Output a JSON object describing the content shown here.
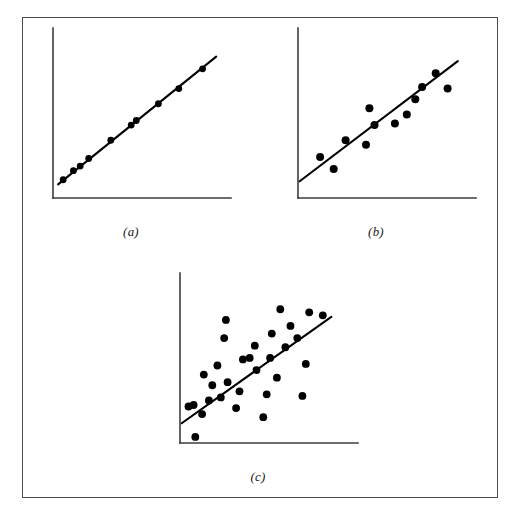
{
  "figure": {
    "caption_a": "(a)",
    "caption_b": "(b)",
    "caption_c": "(c)",
    "border_color": "#4a4a4a",
    "axis_color": "#3d3d3d",
    "line_color": "#000000",
    "point_color": "#000000",
    "background_color": "#ffffff"
  },
  "chart_data": [
    {
      "type": "scatter",
      "id": "panel-a",
      "title": "(a)",
      "xlabel": "",
      "ylabel": "",
      "grid": false,
      "legend": "none",
      "xlim": [
        0,
        100
      ],
      "ylim": [
        0,
        100
      ],
      "axis_ticks": [],
      "description": "Near-perfect positive linear relationship; points lie essentially on the fitted line",
      "fit_line": {
        "x": [
          3,
          96
        ],
        "y": [
          9,
          93
        ]
      },
      "point_radius": 3.4,
      "points": [
        {
          "x": 6,
          "y": 12
        },
        {
          "x": 12,
          "y": 18
        },
        {
          "x": 16,
          "y": 21
        },
        {
          "x": 21,
          "y": 26
        },
        {
          "x": 34,
          "y": 38
        },
        {
          "x": 46,
          "y": 48
        },
        {
          "x": 49,
          "y": 51
        },
        {
          "x": 62,
          "y": 62
        },
        {
          "x": 74,
          "y": 72
        },
        {
          "x": 88,
          "y": 85
        }
      ]
    },
    {
      "type": "scatter",
      "id": "panel-b",
      "title": "(b)",
      "xlabel": "",
      "ylabel": "",
      "grid": false,
      "legend": "none",
      "xlim": [
        0,
        100
      ],
      "ylim": [
        0,
        100
      ],
      "axis_ticks": [],
      "description": "Strong positive linear relationship with moderate scatter about the fitted line",
      "fit_line": {
        "x": [
          1,
          94
        ],
        "y": [
          11,
          90
        ]
      },
      "point_radius": 4.0,
      "points": [
        {
          "x": 13,
          "y": 27
        },
        {
          "x": 21,
          "y": 19
        },
        {
          "x": 28,
          "y": 38
        },
        {
          "x": 40,
          "y": 35
        },
        {
          "x": 42,
          "y": 59
        },
        {
          "x": 45,
          "y": 48
        },
        {
          "x": 57,
          "y": 49
        },
        {
          "x": 64,
          "y": 55
        },
        {
          "x": 69,
          "y": 65
        },
        {
          "x": 73,
          "y": 73
        },
        {
          "x": 81,
          "y": 82
        },
        {
          "x": 88,
          "y": 72
        }
      ]
    },
    {
      "type": "scatter",
      "id": "panel-c",
      "title": "(c)",
      "xlabel": "",
      "ylabel": "",
      "grid": false,
      "legend": "none",
      "xlim": [
        0,
        100
      ],
      "ylim": [
        0,
        100
      ],
      "axis_ticks": [],
      "description": "Moderate positive linear relationship with wide scatter about the fitted line",
      "fit_line": {
        "x": [
          1,
          89
        ],
        "y": [
          13,
          83
        ]
      },
      "point_radius": 3.9,
      "points": [
        {
          "x": 9,
          "y": 4
        },
        {
          "x": 5,
          "y": 24
        },
        {
          "x": 8,
          "y": 25
        },
        {
          "x": 13,
          "y": 19
        },
        {
          "x": 17,
          "y": 28
        },
        {
          "x": 19,
          "y": 38
        },
        {
          "x": 14,
          "y": 45
        },
        {
          "x": 22,
          "y": 51
        },
        {
          "x": 24,
          "y": 30
        },
        {
          "x": 28,
          "y": 40
        },
        {
          "x": 26,
          "y": 69
        },
        {
          "x": 27,
          "y": 81
        },
        {
          "x": 33,
          "y": 23
        },
        {
          "x": 35,
          "y": 34
        },
        {
          "x": 37,
          "y": 55
        },
        {
          "x": 41,
          "y": 56
        },
        {
          "x": 44,
          "y": 64
        },
        {
          "x": 45,
          "y": 48
        },
        {
          "x": 49,
          "y": 17
        },
        {
          "x": 51,
          "y": 32
        },
        {
          "x": 53,
          "y": 56
        },
        {
          "x": 54,
          "y": 72
        },
        {
          "x": 57,
          "y": 43
        },
        {
          "x": 59,
          "y": 88
        },
        {
          "x": 62,
          "y": 63
        },
        {
          "x": 65,
          "y": 77
        },
        {
          "x": 69,
          "y": 69
        },
        {
          "x": 72,
          "y": 31
        },
        {
          "x": 74,
          "y": 52
        },
        {
          "x": 76,
          "y": 86
        },
        {
          "x": 84,
          "y": 84
        }
      ]
    }
  ]
}
